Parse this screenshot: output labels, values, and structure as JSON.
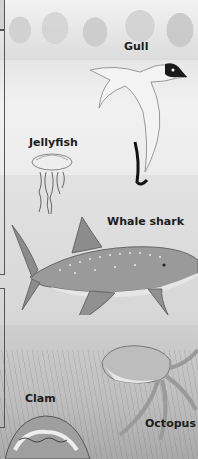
{
  "illustration": {
    "description": "Ocean habitat illustration with labeled animals",
    "labels": {
      "gull": "Gull",
      "jellyfish": "Jellyfish",
      "whale_shark": "Whale shark",
      "clam": "Clam",
      "octopus": "Octopus"
    },
    "zones": [
      "shore",
      "surface water",
      "open water",
      "sea floor"
    ],
    "colors": {
      "sky": "#ececec",
      "water": "#dcdcdc",
      "seabed": "#b8b8b8",
      "label_text": "#1c1c1c",
      "frame_line": "#555555"
    }
  }
}
